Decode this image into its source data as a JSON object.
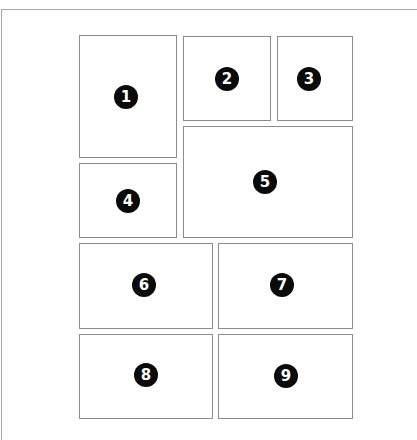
{
  "diagram": {
    "title": "",
    "panels": [
      {
        "id": "1",
        "label": "1",
        "x": 79,
        "y": 35,
        "w": 98,
        "h": 123,
        "badge_x": 126,
        "badge_y": 97
      },
      {
        "id": "2",
        "label": "2",
        "x": 183,
        "y": 36,
        "w": 88,
        "h": 85,
        "badge_x": 227,
        "badge_y": 79
      },
      {
        "id": "3",
        "label": "3",
        "x": 277,
        "y": 36,
        "w": 76,
        "h": 85,
        "badge_x": 309,
        "badge_y": 79
      },
      {
        "id": "4",
        "label": "4",
        "x": 79,
        "y": 163,
        "w": 98,
        "h": 75,
        "badge_x": 128,
        "badge_y": 201
      },
      {
        "id": "5",
        "label": "5",
        "x": 183,
        "y": 126,
        "w": 170,
        "h": 112,
        "badge_x": 265,
        "badge_y": 182
      },
      {
        "id": "6",
        "label": "6",
        "x": 79,
        "y": 243,
        "w": 134,
        "h": 86,
        "badge_x": 144,
        "badge_y": 285
      },
      {
        "id": "7",
        "label": "7",
        "x": 218,
        "y": 243,
        "w": 135,
        "h": 86,
        "badge_x": 282,
        "badge_y": 285
      },
      {
        "id": "8",
        "label": "8",
        "x": 79,
        "y": 334,
        "w": 134,
        "h": 85,
        "badge_x": 146,
        "badge_y": 375
      },
      {
        "id": "9",
        "label": "9",
        "x": 218,
        "y": 334,
        "w": 135,
        "h": 85,
        "badge_x": 286,
        "badge_y": 376
      }
    ],
    "colors": {
      "panel_border": "#8c8c8c",
      "frame_line": "#a8a8a8",
      "badge_fill": "#0a0a0a",
      "badge_text": "#ffffff",
      "background": "#ffffff"
    }
  }
}
